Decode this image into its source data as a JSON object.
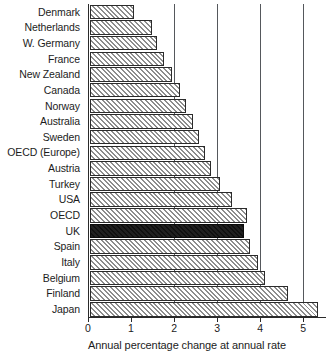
{
  "chart_data": {
    "type": "bar",
    "orientation": "horizontal",
    "title": "",
    "subtitle": "",
    "xlabel": "Annual percentage change at annual rate",
    "ylabel": "",
    "xlim": [
      0,
      5.53
    ],
    "xticks": [
      0,
      1,
      2,
      3,
      4,
      5
    ],
    "xtick_labels": [
      "0",
      "1",
      "2",
      "3",
      "4",
      "5"
    ],
    "grid": true,
    "grid_axis": "x",
    "gridlines_at": [
      2,
      3,
      4,
      5
    ],
    "legend": null,
    "legend_position": "none",
    "highlight_category": "UK",
    "colors": {
      "bar_fill": "#cfcfcf",
      "bar_hatch": "#8d8d8d",
      "bar_edge": "#2b2b2b",
      "highlight_fill": "#1b1b1b",
      "axis": "#2a2a2a",
      "gridline": "#55585c",
      "text": "#1c1c1c",
      "background": "#ffffff"
    },
    "categories": [
      "Denmark",
      "Netherlands",
      "W. Germany",
      "France",
      "New Zealand",
      "Canada",
      "Norway",
      "Australia",
      "Sweden",
      "OECD (Europe)",
      "Austria",
      "Turkey",
      "USA",
      "OECD",
      "UK",
      "Spain",
      "Italy",
      "Belgium",
      "Finland",
      "Japan"
    ],
    "values": [
      1.02,
      1.45,
      1.56,
      1.72,
      1.91,
      2.09,
      2.23,
      2.4,
      2.53,
      2.67,
      2.81,
      3.02,
      3.3,
      3.65,
      3.58,
      3.72,
      3.91,
      4.07,
      4.6,
      5.3
    ],
    "highlighted": [
      false,
      false,
      false,
      false,
      false,
      false,
      false,
      false,
      false,
      false,
      false,
      false,
      false,
      false,
      true,
      false,
      false,
      false,
      false,
      false
    ]
  }
}
